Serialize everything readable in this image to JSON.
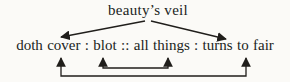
{
  "diagram": {
    "top_term": "beauty’s veil",
    "analogy_line": "doth cover : blot :: all things : turns to fair",
    "colors": {
      "ink": "#201e1b",
      "background": "#fbfaf7"
    }
  }
}
